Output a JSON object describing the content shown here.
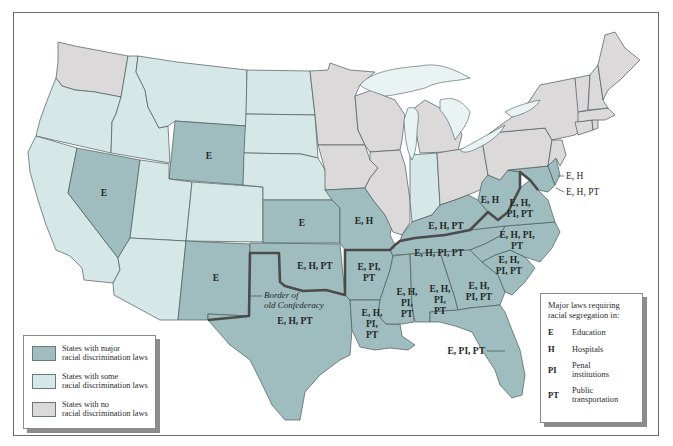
{
  "map": {
    "title": "",
    "categories": {
      "major": {
        "label": "States with major racial discrimination laws",
        "color": "#9fbdbf"
      },
      "some": {
        "label": "States with some racial discrimination laws",
        "color": "#d6e7e7"
      },
      "none": {
        "label": "States with no racial discrimination laws",
        "color": "#dcd9da"
      }
    },
    "confederacy_border_label_line1": "Border of",
    "confederacy_border_label_line2": "old Confederacy",
    "state_labels": {
      "nevada": "E",
      "wyoming": "E",
      "kansas": "E",
      "new_mexico": "E",
      "missouri": "E, H",
      "oklahoma": "E, H, PT",
      "texas": "E, H, PT",
      "arkansas_l1": "E, PI,",
      "arkansas_l2": "PT",
      "louisiana_l1": "E, H,",
      "louisiana_l2": "PI,",
      "louisiana_l3": "PT",
      "mississippi_l1": "E, H,",
      "mississippi_l2": "PI,",
      "mississippi_l3": "PT",
      "alabama_l1": "E, H,",
      "alabama_l2": "PI,",
      "alabama_l3": "PT",
      "georgia_l1": "E, H,",
      "georgia_l2": "PI, PT",
      "south_carolina_l1": "E, H,",
      "south_carolina_l2": "PI, PT",
      "north_carolina_l1": "E, H, PI,",
      "north_carolina_l2": "PT",
      "tennessee": "E, H, PI, PT",
      "kentucky": "E, H, PT",
      "west_virginia": "E, H",
      "virginia_l1": "E, H,",
      "virginia_l2": "PI, PT",
      "florida": "E, PI, PT",
      "delaware": "E, H",
      "maryland": "E, H, PT"
    },
    "state_status": {
      "washington": "none",
      "oregon": "some",
      "california": "some",
      "idaho": "some",
      "nevada": "major",
      "montana": "some",
      "wyoming": "major",
      "utah": "some",
      "arizona": "some",
      "colorado": "some",
      "new_mexico": "major",
      "north_dakota": "some",
      "south_dakota": "some",
      "nebraska": "some",
      "kansas": "major",
      "oklahoma": "major",
      "texas": "major",
      "minnesota": "none",
      "iowa": "none",
      "missouri": "major",
      "arkansas": "major",
      "louisiana": "major",
      "wisconsin": "none",
      "illinois": "none",
      "michigan": "none",
      "indiana": "some",
      "ohio": "none",
      "kentucky": "major",
      "tennessee": "major",
      "mississippi": "major",
      "alabama": "major",
      "georgia": "major",
      "florida": "major",
      "south_carolina": "major",
      "north_carolina": "major",
      "virginia": "major",
      "west_virginia": "major",
      "maryland": "major",
      "delaware": "major",
      "pennsylvania": "none",
      "new_york": "none",
      "new_jersey": "none",
      "connecticut": "none",
      "rhode_island": "none",
      "massachusetts": "none",
      "vermont": "none",
      "new_hampshire": "none",
      "maine": "none"
    }
  },
  "legend_left": {
    "items": [
      {
        "line1": "States with major",
        "line2": "racial discrimination laws",
        "color": "#9fbdbf"
      },
      {
        "line1": "States with some",
        "line2": "racial discrimination laws",
        "color": "#d6e7e7"
      },
      {
        "line1": "States with no",
        "line2": "racial discrimination laws",
        "color": "#dcd9da"
      }
    ]
  },
  "legend_right": {
    "title_line1": "Major laws requiring",
    "title_line2": "racial segregation in:",
    "items": [
      {
        "code": "E",
        "line1": "Education",
        "line2": ""
      },
      {
        "code": "H",
        "line1": "Hospitals",
        "line2": ""
      },
      {
        "code": "PI",
        "line1": "Penal",
        "line2": "institutions"
      },
      {
        "code": "PT",
        "line1": "Public",
        "line2": "transportation"
      }
    ]
  }
}
